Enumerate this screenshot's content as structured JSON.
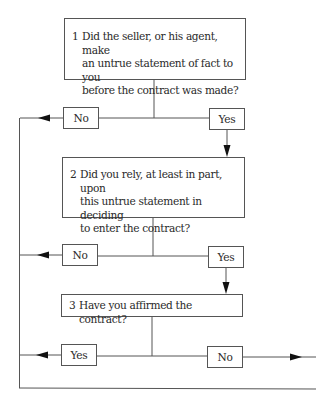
{
  "diagram": {
    "questions": [
      {
        "number": "1",
        "text_lines": [
          "Did the seller, or his agent, make",
          "an untrue statement of fact to you",
          "before the contract was made?"
        ]
      },
      {
        "number": "2",
        "text_lines": [
          "Did you rely, at least in part, upon",
          "this untrue statement in deciding",
          "to enter the contract?"
        ]
      },
      {
        "number": "3",
        "text_lines": [
          "Have you affirmed the contract?"
        ]
      }
    ],
    "answers": {
      "q1_left": "No",
      "q1_right": "Yes",
      "q2_left": "No",
      "q2_right": "Yes",
      "q3_left": "Yes",
      "q3_right": "No"
    },
    "colors": {
      "line": "#555555",
      "text": "#2a2a2a",
      "background": "#ffffff"
    }
  }
}
